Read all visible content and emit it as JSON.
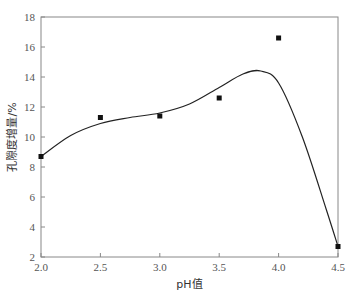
{
  "chart_data": {
    "type": "scatter",
    "title": "",
    "xlabel": "pH值",
    "ylabel": "孔隙度增量/%",
    "xlim": [
      2.0,
      4.5
    ],
    "ylim": [
      2,
      18
    ],
    "x_ticks": [
      "2.0",
      "2.5",
      "3.0",
      "3.5",
      "4.0",
      "4.5"
    ],
    "y_ticks": [
      "2",
      "4",
      "6",
      "8",
      "10",
      "12",
      "14",
      "16",
      "18"
    ],
    "grid": false,
    "legend": null,
    "series": [
      {
        "name": "measured",
        "type": "scatter",
        "marker": "square",
        "x": [
          2.0,
          2.5,
          3.0,
          3.5,
          4.0,
          4.5
        ],
        "y": [
          8.7,
          11.3,
          11.4,
          12.6,
          16.6,
          2.7
        ]
      },
      {
        "name": "fitted curve",
        "type": "line",
        "smooth": true,
        "x": [
          2.0,
          2.25,
          2.5,
          2.75,
          3.0,
          3.25,
          3.5,
          3.7,
          3.85,
          4.0,
          4.2,
          4.4,
          4.5
        ],
        "y": [
          8.7,
          10.1,
          10.9,
          11.3,
          11.6,
          12.2,
          13.3,
          14.2,
          14.4,
          13.6,
          10.0,
          5.2,
          2.7
        ]
      }
    ]
  }
}
